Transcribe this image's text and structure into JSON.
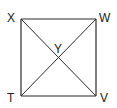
{
  "diagram": {
    "type": "square-with-diagonals",
    "stroke_color": "#2a2a2a",
    "vertices": {
      "X": {
        "label": "X",
        "x": 21,
        "y": 19
      },
      "W": {
        "label": "W",
        "x": 96,
        "y": 19
      },
      "V": {
        "label": "V",
        "x": 96,
        "y": 96
      },
      "T": {
        "label": "T",
        "x": 21,
        "y": 96
      }
    },
    "intersection": {
      "label": "Y",
      "x": 58,
      "y": 58
    },
    "segments": [
      "XW",
      "WV",
      "VT",
      "TX",
      "XV",
      "WT"
    ]
  }
}
